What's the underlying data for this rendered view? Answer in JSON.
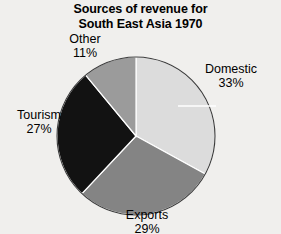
{
  "chart_data": {
    "type": "pie",
    "title": "Sources of revenue for South East Asia 1970",
    "title_lines": [
      "Sources of revenue for",
      "South East Asia 1970"
    ],
    "categories": [
      "Domestic",
      "Exports",
      "Tourism",
      "Other"
    ],
    "values": [
      33,
      29,
      27,
      11
    ],
    "value_unit": "%",
    "value_labels": [
      "33%",
      "29%",
      "27%",
      "11%"
    ],
    "colors": [
      "#dcdcdc",
      "#848484",
      "#121212",
      "#9b9b9b"
    ],
    "start_angle_deg": 0,
    "direction": "clockwise",
    "legend": "none",
    "labels_placement": "outside",
    "xlabel": "",
    "ylabel": "",
    "slices": [
      {
        "name": "Domestic",
        "value": 33,
        "label": "Domestic",
        "value_label": "33%",
        "color": "#dcdcdc"
      },
      {
        "name": "Exports",
        "value": 29,
        "label": "Exports",
        "value_label": "29%",
        "color": "#848484"
      },
      {
        "name": "Tourism",
        "value": 27,
        "label": "Tourism",
        "value_label": "27%",
        "color": "#121212"
      },
      {
        "name": "Other",
        "value": 11,
        "label": "Other",
        "value_label": "11%",
        "color": "#9b9b9b"
      }
    ]
  },
  "chart": {
    "background": "#f0efed",
    "outline_color": "#3a3a3a",
    "separator_color": "#ffffff"
  }
}
